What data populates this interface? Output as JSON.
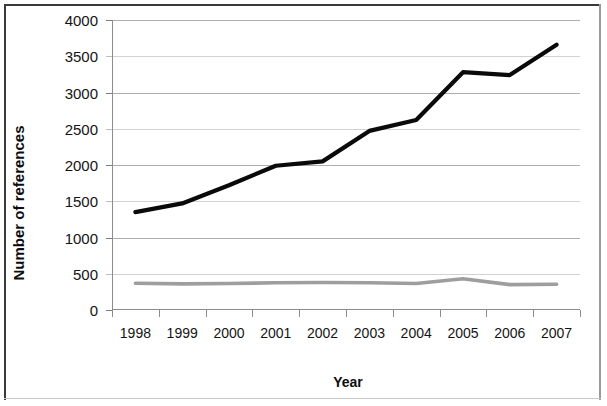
{
  "chart_data": {
    "type": "line",
    "title": "",
    "xlabel": "Year",
    "ylabel": "Number of references",
    "categories": [
      "1998",
      "1999",
      "2000",
      "2001",
      "2002",
      "2003",
      "2004",
      "2005",
      "2006",
      "2007"
    ],
    "series": [
      {
        "name": "black-series",
        "color": "#0a0a0a",
        "values": [
          1350,
          1470,
          1720,
          1990,
          2050,
          2470,
          2620,
          3280,
          3240,
          3660
        ]
      },
      {
        "name": "gray-series",
        "color": "#9e9e9e",
        "values": [
          370,
          360,
          365,
          375,
          380,
          375,
          365,
          430,
          350,
          355
        ]
      }
    ],
    "ylim": [
      0,
      4000
    ],
    "yticks": [
      0,
      500,
      1000,
      1500,
      2000,
      2500,
      3000,
      3500,
      4000
    ],
    "ytick_labels": [
      "0",
      "500",
      "1000",
      "1500",
      "2000",
      "2500",
      "3000",
      "3500",
      "4000"
    ],
    "grid": true,
    "grid_axis": "y",
    "legend": false,
    "legend_position": "none"
  }
}
